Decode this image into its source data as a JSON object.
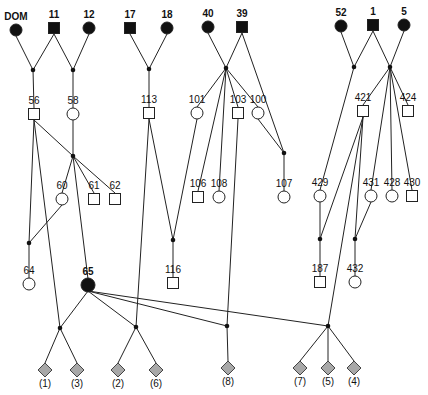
{
  "diagram": {
    "type": "pedigree",
    "colors": {
      "line": "#222222",
      "affected": "#111111",
      "unaffected": "#ffffff",
      "unknown_sex": "#a8a8a8"
    }
  },
  "nodes": [
    {
      "id": "DOM",
      "label": "DOM",
      "shape": "circle",
      "filled": true,
      "x": 16,
      "y": 30
    },
    {
      "id": "11",
      "label": "11",
      "shape": "square",
      "filled": true,
      "x": 54,
      "y": 28
    },
    {
      "id": "12",
      "label": "12",
      "shape": "circle",
      "filled": true,
      "x": 89,
      "y": 28
    },
    {
      "id": "17",
      "label": "17",
      "shape": "square",
      "filled": true,
      "x": 130,
      "y": 28
    },
    {
      "id": "18",
      "label": "18",
      "shape": "circle",
      "filled": true,
      "x": 167,
      "y": 28
    },
    {
      "id": "40",
      "label": "40",
      "shape": "circle",
      "filled": true,
      "x": 208,
      "y": 27
    },
    {
      "id": "39",
      "label": "39",
      "shape": "square",
      "filled": true,
      "x": 242,
      "y": 27
    },
    {
      "id": "52",
      "label": "52",
      "shape": "circle",
      "filled": true,
      "x": 341,
      "y": 26
    },
    {
      "id": "1",
      "label": "1",
      "shape": "square",
      "filled": true,
      "x": 373,
      "y": 25
    },
    {
      "id": "5",
      "label": "5",
      "shape": "circle",
      "filled": true,
      "x": 404,
      "y": 25
    },
    {
      "id": "56",
      "label": "56",
      "shape": "square",
      "filled": false,
      "x": 34,
      "y": 114
    },
    {
      "id": "58",
      "label": "58",
      "shape": "circle",
      "filled": false,
      "x": 73,
      "y": 114
    },
    {
      "id": "113",
      "label": "113",
      "shape": "square",
      "filled": false,
      "x": 149,
      "y": 113
    },
    {
      "id": "101",
      "label": "101",
      "shape": "circle",
      "filled": false,
      "x": 197,
      "y": 113
    },
    {
      "id": "103",
      "label": "103",
      "shape": "square",
      "filled": false,
      "x": 238,
      "y": 113
    },
    {
      "id": "100",
      "label": "100",
      "shape": "circle",
      "filled": false,
      "x": 258,
      "y": 113
    },
    {
      "id": "421",
      "label": "421",
      "shape": "square",
      "filled": false,
      "x": 363,
      "y": 111
    },
    {
      "id": "424",
      "label": "424",
      "shape": "square",
      "filled": false,
      "x": 408,
      "y": 111
    },
    {
      "id": "60",
      "label": "60",
      "shape": "circle",
      "filled": false,
      "x": 62,
      "y": 199
    },
    {
      "id": "61",
      "label": "61",
      "shape": "square",
      "filled": false,
      "x": 94,
      "y": 199
    },
    {
      "id": "62",
      "label": "62",
      "shape": "square",
      "filled": false,
      "x": 115,
      "y": 199
    },
    {
      "id": "106",
      "label": "106",
      "shape": "square",
      "filled": false,
      "x": 198,
      "y": 197
    },
    {
      "id": "108",
      "label": "108",
      "shape": "circle",
      "filled": false,
      "x": 219,
      "y": 197
    },
    {
      "id": "107",
      "label": "107",
      "shape": "circle",
      "filled": false,
      "x": 284,
      "y": 197
    },
    {
      "id": "429",
      "label": "429",
      "shape": "circle",
      "filled": false,
      "x": 320,
      "y": 196
    },
    {
      "id": "431",
      "label": "431",
      "shape": "circle",
      "filled": false,
      "x": 371,
      "y": 196
    },
    {
      "id": "428",
      "label": "428",
      "shape": "circle",
      "filled": false,
      "x": 392,
      "y": 196
    },
    {
      "id": "430",
      "label": "430",
      "shape": "square",
      "filled": false,
      "x": 412,
      "y": 196
    },
    {
      "id": "64",
      "label": "64",
      "shape": "circle",
      "filled": false,
      "x": 29,
      "y": 284
    },
    {
      "id": "65",
      "label": "65",
      "shape": "circle",
      "filled": true,
      "x": 88,
      "y": 285
    },
    {
      "id": "116",
      "label": "116",
      "shape": "square",
      "filled": false,
      "x": 173,
      "y": 283
    },
    {
      "id": "187",
      "label": "187",
      "shape": "square",
      "filled": false,
      "x": 320,
      "y": 282
    },
    {
      "id": "432",
      "label": "432",
      "shape": "circle",
      "filled": false,
      "x": 355,
      "y": 282
    },
    {
      "id": "c1",
      "label": "(1)",
      "shape": "diamond",
      "filled": "grey",
      "x": 45,
      "y": 370
    },
    {
      "id": "c3",
      "label": "(3)",
      "shape": "diamond",
      "filled": "grey",
      "x": 77,
      "y": 370
    },
    {
      "id": "c2",
      "label": "(2)",
      "shape": "diamond",
      "filled": "grey",
      "x": 118,
      "y": 370
    },
    {
      "id": "c6",
      "label": "(6)",
      "shape": "diamond",
      "filled": "grey",
      "x": 156,
      "y": 370
    },
    {
      "id": "c8",
      "label": "(8)",
      "shape": "diamond",
      "filled": "grey",
      "x": 228,
      "y": 368
    },
    {
      "id": "c7",
      "label": "(7)",
      "shape": "diamond",
      "filled": "grey",
      "x": 300,
      "y": 368
    },
    {
      "id": "c5",
      "label": "(5)",
      "shape": "diamond",
      "filled": "grey",
      "x": 328,
      "y": 368
    },
    {
      "id": "c4",
      "label": "(4)",
      "shape": "diamond",
      "filled": "grey",
      "x": 354,
      "y": 368
    }
  ],
  "junctions": [
    {
      "id": "j1",
      "x": 33,
      "y": 70
    },
    {
      "id": "j2",
      "x": 73,
      "y": 70
    },
    {
      "id": "j3",
      "x": 149,
      "y": 69
    },
    {
      "id": "j4",
      "x": 226,
      "y": 68
    },
    {
      "id": "j5",
      "x": 354,
      "y": 67
    },
    {
      "id": "j6",
      "x": 390,
      "y": 67
    },
    {
      "id": "j7",
      "x": 73,
      "y": 156
    },
    {
      "id": "j8",
      "x": 284,
      "y": 153
    },
    {
      "id": "j9",
      "x": 29,
      "y": 243
    },
    {
      "id": "j10",
      "x": 173,
      "y": 240
    },
    {
      "id": "j11",
      "x": 320,
      "y": 239
    },
    {
      "id": "j12",
      "x": 355,
      "y": 239
    },
    {
      "id": "j13",
      "x": 60,
      "y": 328
    },
    {
      "id": "j14",
      "x": 136,
      "y": 327
    },
    {
      "id": "j15",
      "x": 227,
      "y": 326
    },
    {
      "id": "j16",
      "x": 328,
      "y": 326
    }
  ],
  "edges": [
    [
      "DOM",
      "j1"
    ],
    [
      "11",
      "j1"
    ],
    [
      "11",
      "j2"
    ],
    [
      "12",
      "j2"
    ],
    [
      "j1",
      "56"
    ],
    [
      "j2",
      "58"
    ],
    [
      "17",
      "j3"
    ],
    [
      "18",
      "j3"
    ],
    [
      "j3",
      "113"
    ],
    [
      "40",
      "j4"
    ],
    [
      "39",
      "j4"
    ],
    [
      "39",
      "j8"
    ],
    [
      "j4",
      "101"
    ],
    [
      "j4",
      "103"
    ],
    [
      "j4",
      "100"
    ],
    [
      "j4",
      "106"
    ],
    [
      "j4",
      "108"
    ],
    [
      "100",
      "j8"
    ],
    [
      "j8",
      "107"
    ],
    [
      "52",
      "j5"
    ],
    [
      "1",
      "j5"
    ],
    [
      "1",
      "j6"
    ],
    [
      "5",
      "j6"
    ],
    [
      "j5",
      "429"
    ],
    [
      "j6",
      "421"
    ],
    [
      "j6",
      "424"
    ],
    [
      "j6",
      "431"
    ],
    [
      "j6",
      "428"
    ],
    [
      "j6",
      "430"
    ],
    [
      "56",
      "j7"
    ],
    [
      "58",
      "j7"
    ],
    [
      "j7",
      "60"
    ],
    [
      "j7",
      "61"
    ],
    [
      "j7",
      "62"
    ],
    [
      "j7",
      "65"
    ],
    [
      "56",
      "j9"
    ],
    [
      "60",
      "j9"
    ],
    [
      "j9",
      "64"
    ],
    [
      "113",
      "j10"
    ],
    [
      "101",
      "j10"
    ],
    [
      "j10",
      "116"
    ],
    [
      "429",
      "j11"
    ],
    [
      "421",
      "j11"
    ],
    [
      "j11",
      "187"
    ],
    [
      "421",
      "j12"
    ],
    [
      "431",
      "j12"
    ],
    [
      "j12",
      "432"
    ],
    [
      "56",
      "j13"
    ],
    [
      "65",
      "j13"
    ],
    [
      "j13",
      "c1"
    ],
    [
      "j13",
      "c3"
    ],
    [
      "113",
      "j14"
    ],
    [
      "65",
      "j14"
    ],
    [
      "j14",
      "c2"
    ],
    [
      "j14",
      "c6"
    ],
    [
      "103",
      "j15"
    ],
    [
      "65",
      "j15"
    ],
    [
      "j15",
      "c8"
    ],
    [
      "421",
      "j16"
    ],
    [
      "65",
      "j16"
    ],
    [
      "j16",
      "c7"
    ],
    [
      "j16",
      "c5"
    ],
    [
      "j16",
      "c4"
    ]
  ]
}
